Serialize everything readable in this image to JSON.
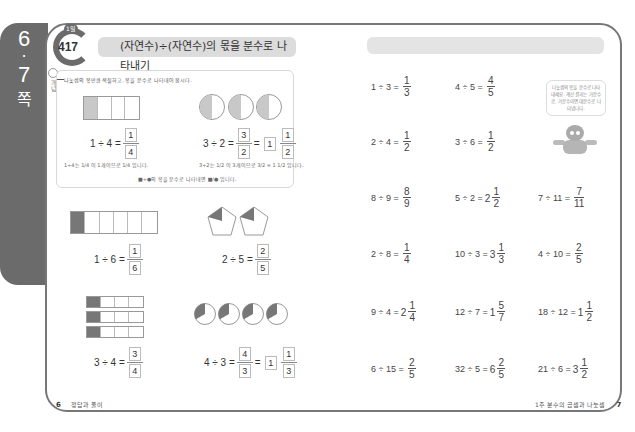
{
  "side_tab": {
    "pages": [
      "6",
      "·",
      "7"
    ],
    "label": "쪽"
  },
  "lesson": {
    "day_label": "1일",
    "number": "417",
    "title": "(자연수)÷(자연수)의 몫을 분수로 나타내기"
  },
  "example": {
    "icon_label": "개념",
    "instruction": "나눗셈의 몫만큼 색칠하고, 몫을 분수로 나타내어 봅시다.",
    "items": [
      {
        "expression": "1 ÷ 4 =",
        "numerator": "1",
        "denominator": "4",
        "note": "1÷4는 1/4 이 1개이므로 1/4 입니다."
      },
      {
        "expression": "3 ÷ 2 =",
        "numerator": "3",
        "denominator": "2",
        "whole": "1",
        "mixed_numerator": "1",
        "mixed_denominator": "2",
        "note": "3÷2는 1/2 이 3개이므로 3/2 = 1 1/2 입니다."
      }
    ],
    "summary": "■÷●의 몫을 분수로 나타내면 ■/● 입니다."
  },
  "exercises_left": [
    {
      "expression": "1 ÷ 6 =",
      "numerator": "1",
      "denominator": "6"
    },
    {
      "expression": "2 ÷ 5 =",
      "numerator": "2",
      "denominator": "5"
    },
    {
      "expression": "3 ÷ 4 =",
      "numerator": "3",
      "denominator": "4"
    },
    {
      "expression": "4 ÷ 3 =",
      "numerator": "4",
      "denominator": "3",
      "whole": "1",
      "mixed_numerator": "1",
      "mixed_denominator": "3"
    }
  ],
  "exercises_right": [
    {
      "expression": "1 ÷ 3 =",
      "whole": "",
      "numerator": "1",
      "denominator": "3"
    },
    {
      "expression": "4 ÷ 5 =",
      "whole": "",
      "numerator": "4",
      "denominator": "5"
    },
    {
      "expression": "2 ÷ 4 =",
      "whole": "",
      "numerator": "1",
      "denominator": "2"
    },
    {
      "expression": "3 ÷ 6 =",
      "whole": "",
      "numerator": "1",
      "denominator": "2"
    },
    {
      "expression": "8 ÷ 9 =",
      "whole": "",
      "numerator": "8",
      "denominator": "9"
    },
    {
      "expression": "5 ÷ 2 =",
      "whole": "2",
      "numerator": "1",
      "denominator": "2"
    },
    {
      "expression": "7 ÷ 11 =",
      "whole": "",
      "numerator": "7",
      "denominator": "11"
    },
    {
      "expression": "2 ÷ 8 =",
      "whole": "",
      "numerator": "1",
      "denominator": "4"
    },
    {
      "expression": "10 ÷ 3 =",
      "whole": "3",
      "numerator": "1",
      "denominator": "3"
    },
    {
      "expression": "4 ÷ 10 =",
      "whole": "",
      "numerator": "2",
      "denominator": "5"
    },
    {
      "expression": "9 ÷ 4 =",
      "whole": "2",
      "numerator": "1",
      "denominator": "4"
    },
    {
      "expression": "12 ÷ 7 =",
      "whole": "1",
      "numerator": "5",
      "denominator": "7"
    },
    {
      "expression": "18 ÷ 12 =",
      "whole": "1",
      "numerator": "1",
      "denominator": "2"
    },
    {
      "expression": "6 ÷ 15 =",
      "whole": "",
      "numerator": "2",
      "denominator": "5"
    },
    {
      "expression": "32 ÷ 5 =",
      "whole": "6",
      "numerator": "2",
      "denominator": "5"
    },
    {
      "expression": "21 ÷ 6 =",
      "whole": "3",
      "numerator": "1",
      "denominator": "2"
    }
  ],
  "mascot": {
    "speech": "나눗셈의 몫을 분수로 나타내세요. 계산 결과는 가분수로, 가분수이면 대분수로 나타냅니다."
  },
  "footer": {
    "left_page": "6",
    "left_label": "정답과 풀이",
    "right_label": "1주 분수의 곱셈과 나눗셈",
    "right_page": "7"
  }
}
